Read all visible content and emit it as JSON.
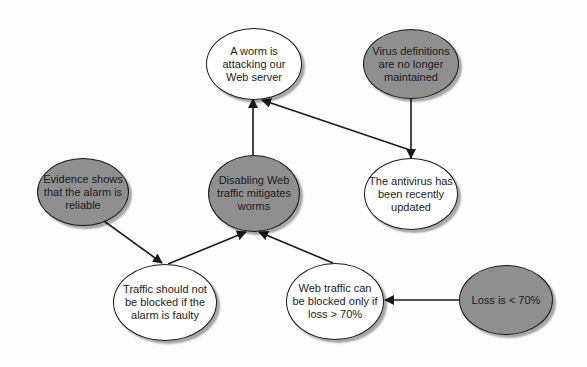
{
  "diagram": {
    "type": "argument-graph",
    "colors": {
      "premise_fill": "#8f8f8f",
      "claim_fill": "#ffffff",
      "stroke": "#1a1a1a"
    },
    "nodes": [
      {
        "id": "worm",
        "label": "A worm is attacking our Web server",
        "lines": [
          "A worm",
          "is attacking our",
          "Web server"
        ],
        "fill": "white"
      },
      {
        "id": "virus",
        "label": "Virus definitions are no longer maintained",
        "lines": [
          "Virus definitions",
          "are no longer",
          "maintained"
        ],
        "fill": "gray"
      },
      {
        "id": "antivirus",
        "label": "The antivirus has been recently updated",
        "lines": [
          "The antivirus",
          "has been",
          "recently updated"
        ],
        "fill": "white"
      },
      {
        "id": "disabling",
        "label": "Disabling Web traffic mitigates worms",
        "lines": [
          "Disabling Web",
          "traffic mitigates",
          "worms"
        ],
        "fill": "gray"
      },
      {
        "id": "evidence",
        "label": "Evidence shows that the alarm is reliable",
        "lines": [
          "Evidence shows",
          "that the alarm is",
          "reliable"
        ],
        "fill": "gray"
      },
      {
        "id": "traffic",
        "label": "Traffic should not be blocked if the alarm is faulty",
        "lines": [
          "Traffic should not",
          "be blocked if the",
          "alarm is faulty"
        ],
        "fill": "white"
      },
      {
        "id": "webtraffic",
        "label": "Web traffic can be blocked only if loss > 70%",
        "lines": [
          "Web traffic",
          "can be blocked",
          "only if loss >",
          "70%"
        ],
        "fill": "white"
      },
      {
        "id": "loss",
        "label": "Loss is < 70%",
        "lines": [
          "Loss is < 70%"
        ],
        "fill": "gray"
      }
    ],
    "edges": [
      {
        "from": "disabling",
        "to": "worm"
      },
      {
        "from": "antivirus",
        "to": "worm"
      },
      {
        "from": "virus",
        "to": "antivirus"
      },
      {
        "from": "evidence",
        "to": "traffic"
      },
      {
        "from": "traffic",
        "to": "disabling"
      },
      {
        "from": "webtraffic",
        "to": "disabling"
      },
      {
        "from": "loss",
        "to": "webtraffic"
      }
    ]
  }
}
